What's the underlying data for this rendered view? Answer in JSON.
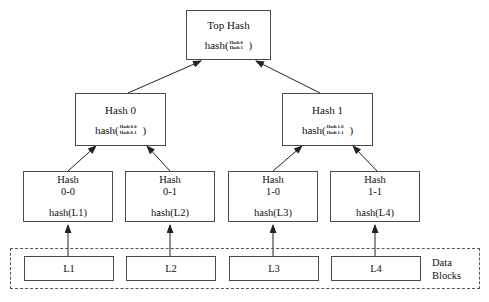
{
  "diagram": {
    "colors": {
      "box_border": "#4a4a4a",
      "dashed_border": "#555555",
      "line": "#222222",
      "text": "#111111",
      "background": "#ffffff"
    },
    "top_hash": {
      "title": "Top Hash",
      "fn_open": "hash(",
      "fn_close": ")",
      "args": [
        "Hash 0",
        "Hash 1"
      ]
    },
    "internal_nodes": [
      {
        "title": "Hash 0",
        "fn_open": "hash(",
        "fn_close": ")",
        "args": [
          "Hash 0-0",
          "Hash 0-1"
        ]
      },
      {
        "title": "Hash 1",
        "fn_open": "hash(",
        "fn_close": ")",
        "args": [
          "Hash 1-0",
          "Hash 1-1"
        ]
      }
    ],
    "leaf_nodes": [
      {
        "line1": "Hash",
        "line2": "0-0",
        "formula": "hash(L1)"
      },
      {
        "line1": "Hash",
        "line2": "0-1",
        "formula": "hash(L2)"
      },
      {
        "line1": "Hash",
        "line2": "1-0",
        "formula": "hash(L3)"
      },
      {
        "line1": "Hash",
        "line2": "1-1",
        "formula": "hash(L4)"
      }
    ],
    "data_blocks": {
      "label_line1": "Data",
      "label_line2": "Blocks",
      "blocks": [
        {
          "label": "L1"
        },
        {
          "label": "L2"
        },
        {
          "label": "L3"
        },
        {
          "label": "L4"
        }
      ]
    }
  }
}
